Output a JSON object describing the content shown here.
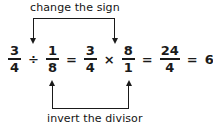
{
  "figure": {
    "type": "math-annotated-equation",
    "topic": "dividing fractions: keep, change, flip",
    "background_color": "#ffffff",
    "ink_color": "#1a1a1a"
  },
  "annotations": {
    "top": {
      "label": "change the sign",
      "arrow_direction": "down",
      "points_to": [
        "division-operator",
        "multiplication-operator"
      ]
    },
    "bottom": {
      "label": "invert the divisor",
      "arrow_direction": "up",
      "points_to": [
        "fraction-one-eighth",
        "fraction-eight-over-one"
      ]
    }
  },
  "equation": {
    "tokens": [
      {
        "kind": "fraction",
        "name": "fraction-three-fourths",
        "numerator": "3",
        "denominator": "4"
      },
      {
        "kind": "operator",
        "name": "division-operator",
        "symbol": "÷"
      },
      {
        "kind": "fraction",
        "name": "fraction-one-eighth",
        "numerator": "1",
        "denominator": "8"
      },
      {
        "kind": "operator",
        "name": "equals-operator-1",
        "symbol": "="
      },
      {
        "kind": "fraction",
        "name": "fraction-three-fourths-2",
        "numerator": "3",
        "denominator": "4"
      },
      {
        "kind": "operator",
        "name": "multiplication-operator",
        "symbol": "×"
      },
      {
        "kind": "fraction",
        "name": "fraction-eight-over-one",
        "numerator": "8",
        "denominator": "1"
      },
      {
        "kind": "operator",
        "name": "equals-operator-2",
        "symbol": "="
      },
      {
        "kind": "fraction",
        "name": "fraction-twentyfour-fourths",
        "numerator": "24",
        "denominator": "4"
      },
      {
        "kind": "operator",
        "name": "equals-operator-3",
        "symbol": "="
      },
      {
        "kind": "whole",
        "name": "result-six",
        "value": "6"
      }
    ],
    "plain_text": "3/4 ÷ 1/8 = 3/4 × 8/1 = 24/4 = 6",
    "result": "6"
  }
}
